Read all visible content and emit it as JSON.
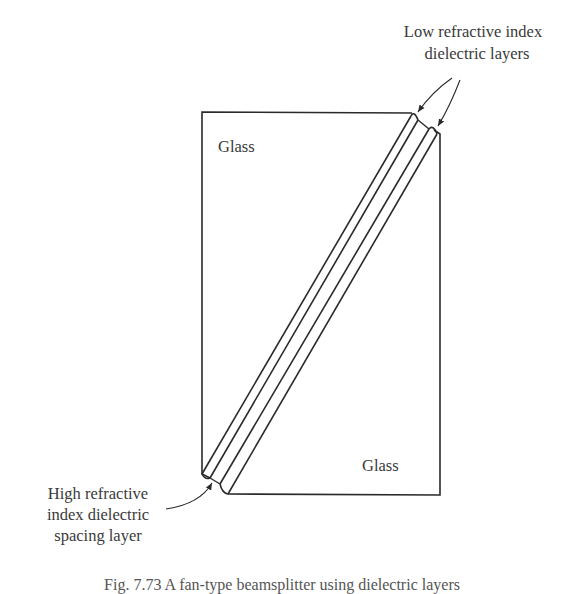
{
  "figure": {
    "labels": {
      "glass_top": "Glass",
      "glass_bottom": "Glass",
      "low_index_line1": "Low refractive index",
      "low_index_line2": "dielectric layers",
      "high_index_line1": "High refractive",
      "high_index_line2": "index dielectric",
      "high_index_line3": "spacing layer"
    },
    "caption": "Fig. 7.73 A fan-type beamsplitter using dielectric layers",
    "colors": {
      "stroke": "#2a2a2a",
      "text": "#3a3a3a",
      "background": "#ffffff"
    }
  }
}
